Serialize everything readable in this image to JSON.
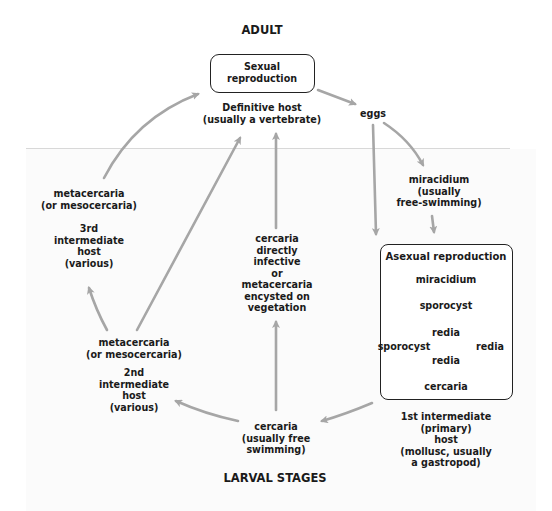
{
  "diagram": {
    "type": "life-cycle",
    "section_titles": {
      "top": "ADULT",
      "bottom": "LARVAL STAGES"
    },
    "sexual_box": {
      "lines": [
        "Sexual",
        "reproduction"
      ]
    },
    "definitive_host": {
      "lines": [
        "Definitive host",
        "(usually a vertebrate)"
      ]
    },
    "eggs": {
      "lines": [
        "eggs"
      ]
    },
    "miracidium_free": {
      "lines": [
        "miracidium",
        "(usually",
        "free-swimming)"
      ]
    },
    "asexual_box": {
      "title": "Asexual reproduction",
      "miracidium": "miracidium",
      "sporocyst_top": "sporocyst",
      "sporocyst_left": "sporocyst",
      "redia_center1": "redia",
      "redia_center2": "redia",
      "redia_right": "redia",
      "cercaria": "cercaria"
    },
    "first_host": {
      "lines": [
        "1st intermediate",
        "(primary)",
        "host",
        "(mollusc, usually",
        "a gastropod)"
      ]
    },
    "cercaria_free": {
      "lines": [
        "cercaria",
        "(usually free",
        "swimming)"
      ]
    },
    "cercaria_direct": {
      "lines": [
        "cercaria",
        "directly",
        "infective",
        "or",
        "metacercaria",
        "encysted on",
        "vegetation"
      ]
    },
    "second_host": {
      "stage": [
        "metacercaria",
        "(or mesocercaria)"
      ],
      "host": [
        "2nd",
        "intermediate",
        "host",
        "(various)"
      ]
    },
    "third_host": {
      "stage": [
        "metacercaria",
        "(or mesocercaria)"
      ],
      "host": [
        "3rd",
        "intermediate",
        "host",
        "(various)"
      ]
    },
    "colors": {
      "arrow": "#a6a6a6",
      "text": "#1a1a1a",
      "box_border": "#222222"
    },
    "edges": [
      [
        "sexual reproduction",
        "eggs"
      ],
      [
        "eggs",
        "miracidium (free-swimming)"
      ],
      [
        "eggs",
        "asexual reproduction (eaten by mollusc)"
      ],
      [
        "miracidium (free-swimming)",
        "asexual reproduction"
      ],
      [
        "asexual reproduction",
        "cercaria (free swimming)"
      ],
      [
        "cercaria (free swimming)",
        "cercaria directly infective / metacercaria on vegetation"
      ],
      [
        "cercaria directly infective / metacercaria on vegetation",
        "definitive host"
      ],
      [
        "cercaria (free swimming)",
        "2nd intermediate host"
      ],
      [
        "2nd intermediate host",
        "definitive host"
      ],
      [
        "2nd intermediate host",
        "3rd intermediate host"
      ],
      [
        "3rd intermediate host",
        "definitive host"
      ]
    ]
  }
}
